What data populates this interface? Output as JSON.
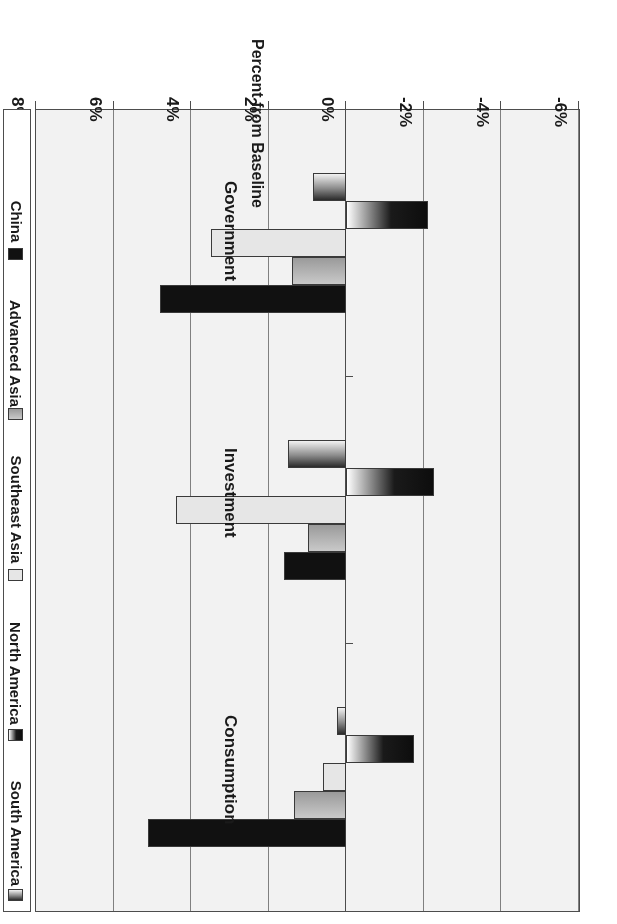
{
  "chart_data": {
    "type": "bar",
    "orientation": "horizontal",
    "title": "",
    "xlabel": "Percent from Baseline",
    "ylabel": "",
    "categories": [
      "Consumption",
      "Investment",
      "Government"
    ],
    "axis_ticks": [
      "-6%",
      "-4%",
      "-2%",
      "0%",
      "2%",
      "4%",
      "6%",
      "8%"
    ],
    "xlim": [
      -6,
      8
    ],
    "grid": true,
    "legend_position": "right",
    "series": [
      {
        "name": "China",
        "color": "#111111",
        "values": [
          5.1,
          1.6,
          4.8
        ]
      },
      {
        "name": "Advanced Asia",
        "color": "#b0b0b0",
        "values": [
          1.35,
          1.0,
          1.4
        ]
      },
      {
        "name": "Southeast Asia",
        "color": "#e6e6e6",
        "values": [
          0.6,
          4.4,
          3.5
        ]
      },
      {
        "name": "North America",
        "color": "#1a1a1a",
        "values": [
          -1.75,
          -2.25,
          -2.1
        ]
      },
      {
        "name": "South America",
        "color": "#8c8c8c",
        "values": [
          0.25,
          1.5,
          0.85
        ]
      }
    ]
  },
  "axis": {
    "title": "Percent from Baseline"
  },
  "legend": {
    "items": [
      {
        "label": "China",
        "swatch": "legend-swatch-china"
      },
      {
        "label": "Advanced Asia",
        "swatch": "legend-swatch-advanced-asia"
      },
      {
        "label": "Southeast Asia",
        "swatch": "legend-swatch-southeast-asia"
      },
      {
        "label": "North America",
        "swatch": "legend-swatch-north-america"
      },
      {
        "label": "South America",
        "swatch": "legend-swatch-south-america"
      }
    ]
  }
}
